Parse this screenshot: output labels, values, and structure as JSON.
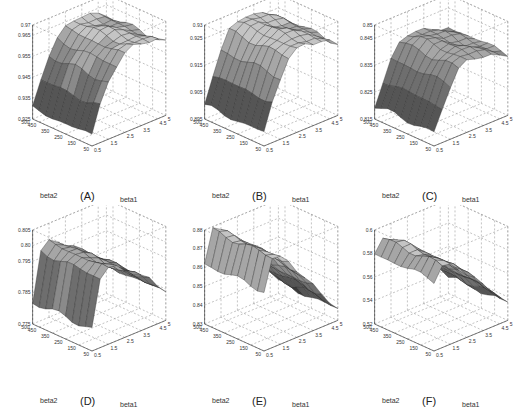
{
  "figure": {
    "layout": "2 rows x 3 columns of 3D surface plots",
    "surface_palette": [
      "#3a3a3a",
      "#555555",
      "#6e6e6e",
      "#8a8a8a",
      "#a6a6a6",
      "#c4c4c4"
    ],
    "grid_line_color": "#9a9a9a"
  },
  "chart_data": [
    {
      "id": "A",
      "panel_label": "(A)",
      "type": "surface",
      "xlabel": "beta1",
      "ylabel": "beta2",
      "x_ticks": [
        "0.5",
        "1.5",
        "2.5",
        "3.5",
        "4.5",
        "5"
      ],
      "y_ticks": [
        "50",
        "150",
        "250",
        "350",
        "450",
        "500"
      ],
      "z_ticks": [
        "0.925",
        "0.935",
        "0.945",
        "0.955",
        "0.965",
        "0.97"
      ],
      "zlim": [
        0.925,
        0.97
      ],
      "x": [
        0.5,
        1.0,
        1.5,
        2.0,
        2.5,
        3.0,
        3.5,
        4.0,
        4.5,
        5.0
      ],
      "y": [
        50,
        100,
        150,
        200,
        250,
        300,
        350,
        400,
        450,
        500
      ],
      "z_profile_by_beta1": [
        0.93,
        0.942,
        0.952,
        0.958,
        0.962,
        0.964,
        0.964,
        0.963,
        0.962,
        0.96
      ]
    },
    {
      "id": "B",
      "panel_label": "(B)",
      "type": "surface",
      "xlabel": "beta1",
      "ylabel": "beta2",
      "x_ticks": [
        "0.5",
        "1.5",
        "2.5",
        "3.5",
        "4.5",
        "5"
      ],
      "y_ticks": [
        "50",
        "150",
        "250",
        "350",
        "450",
        "500"
      ],
      "z_ticks": [
        "0.895",
        "0.905",
        "0.915",
        "0.925",
        "0.93"
      ],
      "zlim": [
        0.895,
        0.93
      ],
      "x": [
        0.5,
        1.0,
        1.5,
        2.0,
        2.5,
        3.0,
        3.5,
        4.0,
        4.5,
        5.0
      ],
      "y": [
        50,
        100,
        150,
        200,
        250,
        300,
        350,
        400,
        450,
        500
      ],
      "z_profile_by_beta1": [
        0.9,
        0.91,
        0.918,
        0.924,
        0.926,
        0.927,
        0.926,
        0.925,
        0.924,
        0.922
      ]
    },
    {
      "id": "C",
      "panel_label": "(C)",
      "type": "surface",
      "xlabel": "beta1",
      "ylabel": "beta2",
      "x_ticks": [
        "0.5",
        "1.5",
        "2.5",
        "3.5",
        "4.5",
        "5"
      ],
      "y_ticks": [
        "50",
        "150",
        "250",
        "350",
        "450",
        "500"
      ],
      "z_ticks": [
        "0.815",
        "0.825",
        "0.835",
        "0.845",
        "0.85"
      ],
      "zlim": [
        0.815,
        0.85
      ],
      "x": [
        0.5,
        1.0,
        1.5,
        2.0,
        2.5,
        3.0,
        3.5,
        4.0,
        4.5,
        5.0
      ],
      "y": [
        50,
        100,
        150,
        200,
        250,
        300,
        350,
        400,
        450,
        500
      ],
      "z_profile_by_beta1": [
        0.82,
        0.828,
        0.835,
        0.84,
        0.842,
        0.842,
        0.841,
        0.84,
        0.839,
        0.838
      ]
    },
    {
      "id": "D",
      "panel_label": "(D)",
      "type": "surface",
      "xlabel": "beta1",
      "ylabel": "beta2",
      "x_ticks": [
        "0.5",
        "1.5",
        "2.5",
        "3.5",
        "4.5",
        "5"
      ],
      "y_ticks": [
        "50",
        "150",
        "250",
        "350",
        "450",
        "500"
      ],
      "z_ticks": [
        "0.775",
        "0.785",
        "0.795",
        "0.80",
        "0.805"
      ],
      "zlim": [
        0.775,
        0.805
      ],
      "x": [
        0.5,
        1.0,
        1.5,
        2.0,
        2.5,
        3.0,
        3.5,
        4.0,
        4.5,
        5.0
      ],
      "y": [
        50,
        100,
        150,
        200,
        250,
        300,
        350,
        400,
        450,
        500
      ],
      "z_profile_by_beta1": [
        0.782,
        0.797,
        0.799,
        0.798,
        0.796,
        0.794,
        0.792,
        0.79,
        0.787,
        0.784
      ]
    },
    {
      "id": "E",
      "panel_label": "(E)",
      "type": "surface",
      "xlabel": "beta1",
      "ylabel": "beta2",
      "x_ticks": [
        "0.5",
        "1.5",
        "2.5",
        "3.5",
        "4.5",
        "5"
      ],
      "y_ticks": [
        "50",
        "150",
        "250",
        "350",
        "450",
        "500"
      ],
      "z_ticks": [
        "0.83",
        "0.84",
        "0.85",
        "0.86",
        "0.87",
        "0.88"
      ],
      "zlim": [
        0.83,
        0.88
      ],
      "x": [
        0.5,
        1.0,
        1.5,
        2.0,
        2.5,
        3.0,
        3.5,
        4.0,
        4.5,
        5.0
      ],
      "y": [
        50,
        100,
        150,
        200,
        250,
        300,
        350,
        400,
        450,
        500
      ],
      "z_profile_by_beta1": [
        0.862,
        0.878,
        0.876,
        0.872,
        0.866,
        0.86,
        0.854,
        0.848,
        0.842,
        0.836
      ]
    },
    {
      "id": "F",
      "panel_label": "(F)",
      "type": "surface",
      "xlabel": "beta1",
      "ylabel": "beta2",
      "x_ticks": [
        "0.5",
        "1.5",
        "2.5",
        "3.5",
        "4.5",
        "5"
      ],
      "y_ticks": [
        "50",
        "150",
        "250",
        "350",
        "450",
        "500"
      ],
      "z_ticks": [
        "0.52",
        "0.54",
        "0.56",
        "0.58",
        "0.6"
      ],
      "zlim": [
        0.52,
        0.6
      ],
      "x": [
        0.5,
        1.0,
        1.5,
        2.0,
        2.5,
        3.0,
        3.5,
        4.0,
        4.5,
        5.0
      ],
      "y": [
        50,
        100,
        150,
        200,
        250,
        300,
        350,
        400,
        450,
        500
      ],
      "z_profile_by_beta1": [
        0.58,
        0.59,
        0.588,
        0.582,
        0.575,
        0.568,
        0.56,
        0.552,
        0.543,
        0.535
      ]
    }
  ]
}
